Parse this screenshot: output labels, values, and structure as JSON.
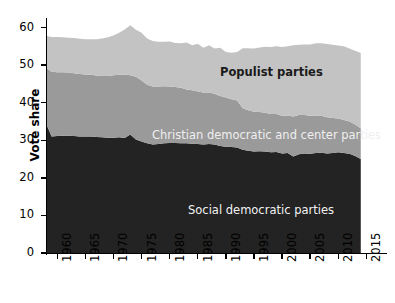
{
  "chart_data": {
    "type": "area",
    "stacked": true,
    "title": "",
    "xlabel": "",
    "ylabel": "Vote share",
    "xlim": [
      1958,
      2016
    ],
    "ylim": [
      0,
      62
    ],
    "ytick_labels": [
      "0",
      "10",
      "20",
      "30",
      "40",
      "50",
      "60"
    ],
    "yticks": [
      0,
      10,
      20,
      30,
      40,
      50,
      60
    ],
    "xtick_labels": [
      "1960",
      "1965",
      "1970",
      "1975",
      "1980",
      "1985",
      "1990",
      "1995",
      "2000",
      "2005",
      "2010",
      "2015"
    ],
    "xticks": [
      1960,
      1965,
      1970,
      1975,
      1980,
      1985,
      1990,
      1995,
      2000,
      2005,
      2010,
      2015
    ],
    "grid": false,
    "legend_position": "in-plot-annotations",
    "x": [
      1958,
      1959,
      1960,
      1961,
      1962,
      1963,
      1964,
      1965,
      1966,
      1967,
      1968,
      1969,
      1970,
      1971,
      1972,
      1973,
      1974,
      1975,
      1976,
      1977,
      1978,
      1979,
      1980,
      1981,
      1982,
      1983,
      1984,
      1985,
      1986,
      1987,
      1988,
      1989,
      1990,
      1991,
      1992,
      1993,
      1994,
      1995,
      1996,
      1997,
      1998,
      1999,
      2000,
      2001,
      2002,
      2003,
      2004,
      2005,
      2006,
      2007,
      2008,
      2009,
      2010,
      2011,
      2012,
      2013,
      2014
    ],
    "series": [
      {
        "name": "Social democratic parties",
        "color": "#232323",
        "values": [
          34.5,
          31.0,
          31.1,
          31.2,
          31.2,
          31.1,
          31.0,
          31.0,
          31.0,
          30.9,
          30.8,
          30.7,
          30.7,
          30.8,
          30.6,
          31.5,
          30.2,
          29.7,
          29.2,
          28.9,
          29.0,
          29.2,
          29.3,
          29.3,
          29.2,
          29.2,
          29.1,
          29.0,
          28.9,
          29.0,
          28.9,
          28.5,
          28.3,
          28.2,
          28.1,
          27.5,
          27.2,
          27.0,
          27.1,
          27.0,
          26.8,
          26.9,
          26.5,
          26.6,
          25.7,
          26.3,
          26.5,
          26.4,
          26.6,
          26.7,
          26.5,
          26.6,
          26.8,
          26.6,
          26.4,
          25.8,
          25.0
        ]
      },
      {
        "name": "Christian democratic and center parties",
        "color": "#9a9a9a",
        "values": [
          14.8,
          17.2,
          17.0,
          16.9,
          16.8,
          16.7,
          16.6,
          16.5,
          16.4,
          16.3,
          16.3,
          16.4,
          16.6,
          16.6,
          16.9,
          15.8,
          16.7,
          16.2,
          15.6,
          15.4,
          15.3,
          15.2,
          15.0,
          14.9,
          14.8,
          14.3,
          14.2,
          14.0,
          13.8,
          13.7,
          13.5,
          13.3,
          13.1,
          12.7,
          12.5,
          11.0,
          10.8,
          10.6,
          10.4,
          10.3,
          10.2,
          10.1,
          10.0,
          10.0,
          10.6,
          10.4,
          10.2,
          10.1,
          10.0,
          9.8,
          9.6,
          9.3,
          9.0,
          8.8,
          8.6,
          8.4,
          8.2
        ]
      },
      {
        "name": "Populist parties",
        "color": "#c3c3c3",
        "values": [
          8.5,
          9.3,
          9.4,
          9.3,
          9.3,
          9.4,
          9.4,
          9.4,
          9.5,
          9.7,
          10.0,
          10.3,
          10.6,
          11.2,
          12.0,
          13.3,
          12.5,
          12.7,
          12.3,
          12.1,
          11.9,
          11.8,
          12.0,
          11.7,
          11.8,
          12.5,
          12.0,
          12.7,
          11.9,
          12.6,
          12.0,
          12.8,
          12.1,
          12.4,
          12.9,
          16.0,
          16.5,
          16.8,
          17.2,
          17.6,
          17.8,
          18.0,
          18.3,
          18.4,
          19.0,
          18.7,
          18.8,
          19.0,
          19.2,
          19.3,
          19.5,
          19.5,
          19.4,
          19.6,
          19.4,
          19.6,
          20.0
        ]
      }
    ],
    "annotations": [
      {
        "text": "Populist parties",
        "x": 1983,
        "y": 53,
        "color": "#1a1a1a"
      },
      {
        "text": "Christian democratic and center parties",
        "x": 1978,
        "y": 36,
        "color": "#efefef"
      },
      {
        "text": "Social democratic parties",
        "x": 1984,
        "y": 14,
        "color": "#f2f2f2"
      }
    ]
  },
  "axis": {
    "ylabel": "Vote share"
  },
  "labels": {
    "populist": "Populist parties",
    "christian": "Christian democratic and center parties",
    "social": "Social democratic parties"
  }
}
